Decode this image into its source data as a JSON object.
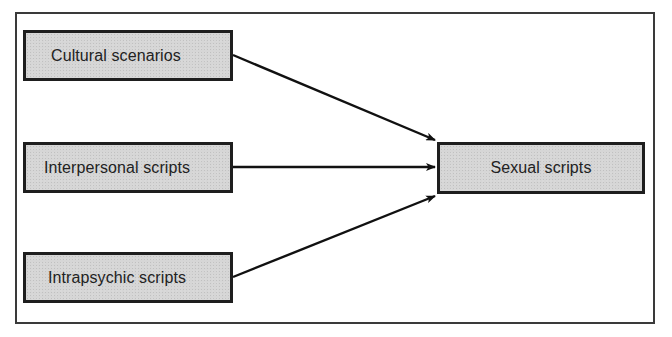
{
  "diagram": {
    "type": "flow",
    "direction": "left-to-right",
    "nodes": [
      {
        "id": "cultural",
        "label": "Cultural scenarios"
      },
      {
        "id": "interpersonal",
        "label": "Interpersonal scripts"
      },
      {
        "id": "intrapsychic",
        "label": "Intrapsychic scripts"
      }
    ],
    "target": {
      "id": "sexual",
      "label": "Sexual scripts"
    },
    "edges": [
      {
        "from": "cultural",
        "to": "sexual"
      },
      {
        "from": "interpersonal",
        "to": "sexual"
      },
      {
        "from": "intrapsychic",
        "to": "sexual"
      }
    ],
    "colors": {
      "box_fill": "#d6d6d6",
      "box_border": "#1e1e1e",
      "arrow": "#111111",
      "frame": "#3a3a3a",
      "text": "#222222"
    }
  }
}
